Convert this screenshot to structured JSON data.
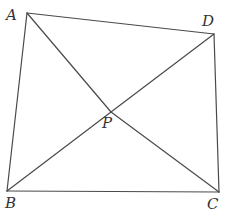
{
  "figure": {
    "type": "quadrilateral-with-interior-point",
    "line_color": "#4a4a4a",
    "label_color": "#333333",
    "points": {
      "A": {
        "label": "A",
        "x": 27,
        "y": 13,
        "lx": 6,
        "ly": 20
      },
      "B": {
        "label": "B",
        "x": 7,
        "y": 191,
        "lx": 5,
        "ly": 208
      },
      "C": {
        "label": "C",
        "x": 219,
        "y": 192,
        "lx": 207,
        "ly": 209
      },
      "D": {
        "label": "D",
        "x": 214,
        "y": 34,
        "lx": 202,
        "ly": 26
      },
      "P": {
        "label": "P",
        "x": 111,
        "y": 112,
        "lx": 102,
        "ly": 128
      }
    },
    "segments": [
      [
        "A",
        "D"
      ],
      [
        "D",
        "C"
      ],
      [
        "C",
        "B"
      ],
      [
        "B",
        "A"
      ],
      [
        "A",
        "P"
      ],
      [
        "P",
        "C"
      ],
      [
        "B",
        "P"
      ],
      [
        "P",
        "D"
      ]
    ]
  }
}
